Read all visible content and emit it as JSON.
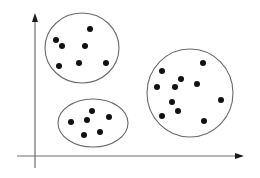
{
  "diagram": {
    "title": "",
    "colors": {
      "axis": "#6e6e6e",
      "arrow": "#1a1a1a",
      "outline": "#6a6a6a",
      "point": "#111111",
      "background": "#ffffff"
    },
    "axes": {
      "origin": [
        35,
        156
      ],
      "x_axis": {
        "start": [
          17,
          156
        ],
        "end": [
          244,
          156
        ]
      },
      "y_axis": {
        "start": [
          35,
          168
        ],
        "end": [
          35,
          13
        ]
      }
    },
    "clusters": [
      {
        "name": "cluster-top-left",
        "ellipse": {
          "cx": 82,
          "cy": 48,
          "rx": 37,
          "ry": 35
        },
        "points": [
          [
            90,
            29
          ],
          [
            56,
            40
          ],
          [
            62,
            46
          ],
          [
            85,
            46
          ],
          [
            59,
            66
          ],
          [
            79,
            63
          ],
          [
            106,
            63
          ]
        ]
      },
      {
        "name": "cluster-bottom-left",
        "ellipse": {
          "cx": 93,
          "cy": 123,
          "rx": 35,
          "ry": 24
        },
        "points": [
          [
            92,
            111
          ],
          [
            71,
            122
          ],
          [
            87,
            120
          ],
          [
            109,
            117
          ],
          [
            84,
            135
          ],
          [
            100,
            132
          ]
        ]
      },
      {
        "name": "cluster-right",
        "ellipse": {
          "cx": 190,
          "cy": 93,
          "rx": 43,
          "ry": 44
        },
        "points": [
          [
            203,
            63
          ],
          [
            162,
            71
          ],
          [
            181,
            79
          ],
          [
            157,
            87
          ],
          [
            175,
            87
          ],
          [
            197,
            84
          ],
          [
            221,
            100
          ],
          [
            172,
            102
          ],
          [
            178,
            111
          ],
          [
            162,
            116
          ],
          [
            204,
            121
          ]
        ]
      }
    ],
    "point_radius": 3
  }
}
